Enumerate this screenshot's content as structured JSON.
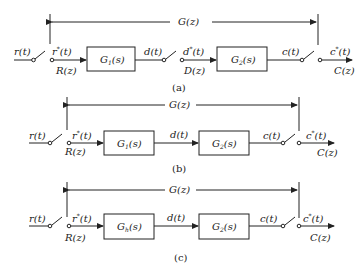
{
  "diagrams": [
    {
      "caption": "(a)",
      "transfer": "G(z)",
      "input": "r(t)",
      "sampled_input": "r",
      "sampled_input_star": "*",
      "sampled_input_arg": "(t)",
      "input_z": "R(z)",
      "block1": {
        "name": "G",
        "sub": "1",
        "arg": "(s)"
      },
      "mid_signal": "d(t)",
      "mid_sampled": "d",
      "mid_sampled_star": "*",
      "mid_sampled_arg": "(t)",
      "mid_z": "D(z)",
      "block2": {
        "name": "G",
        "sub": "2",
        "arg": "(s)"
      },
      "output": "c(t)",
      "sampled_output": "c",
      "sampled_output_star": "*",
      "sampled_output_arg": "(t)",
      "output_z": "C(z)"
    },
    {
      "caption": "(b)",
      "transfer": "G(z)",
      "input": "r(t)",
      "sampled_input": "r",
      "sampled_input_star": "*",
      "sampled_input_arg": "(t)",
      "input_z": "R(z)",
      "block1": {
        "name": "G",
        "sub": "1",
        "arg": "(s)"
      },
      "mid_signal": "d(t)",
      "block2": {
        "name": "G",
        "sub": "2",
        "arg": "(s)"
      },
      "output": "c(t)",
      "sampled_output": "c",
      "sampled_output_star": "*",
      "sampled_output_arg": "(t)",
      "output_z": "C(z)"
    },
    {
      "caption": "(c)",
      "transfer": "G(z)",
      "input": "r(t)",
      "sampled_input": "r",
      "sampled_input_star": "*",
      "sampled_input_arg": "(t)",
      "input_z": "R(z)",
      "block1": {
        "name": "G",
        "sub": "h",
        "arg": "(s)"
      },
      "mid_signal": "d(t)",
      "block2": {
        "name": "G",
        "sub": "2",
        "arg": "(s)"
      },
      "output": "c(t)",
      "sampled_output": "c",
      "sampled_output_star": "*",
      "sampled_output_arg": "(t)",
      "output_z": "C(z)"
    }
  ]
}
